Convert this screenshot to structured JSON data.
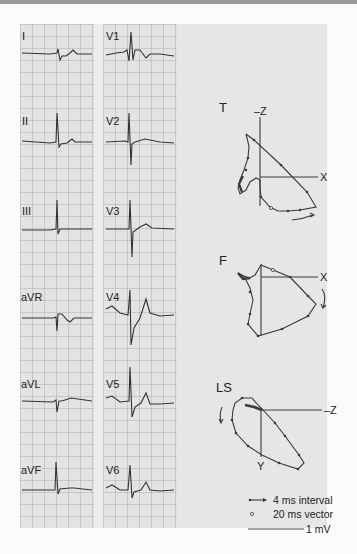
{
  "ecg": {
    "left_leads": [
      "I",
      "II",
      "III",
      "aVR",
      "aVL",
      "aVF"
    ],
    "right_leads": [
      "V1",
      "V2",
      "V3",
      "V4",
      "V5",
      "V6"
    ]
  },
  "vectorcardiogram": {
    "planes": [
      {
        "label": "T",
        "vertical_axis": "–Z",
        "horizontal_axis": "X"
      },
      {
        "label": "F",
        "horizontal_axis": "X"
      },
      {
        "label": "LS",
        "horizontal_axis": "–Z",
        "vertical_axis": "Y"
      }
    ]
  },
  "legend": {
    "interval": "4 ms interval",
    "vector": "20 ms vector",
    "scale": "1 mV"
  }
}
